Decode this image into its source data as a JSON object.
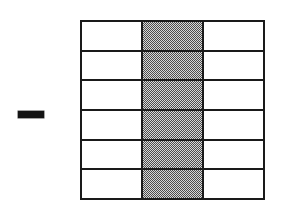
{
  "figure": {
    "operator_symbol": "—",
    "operator_name": "minus-dash",
    "rows": 6,
    "columns": 3,
    "total_cells": 18,
    "shaded_cells": 6,
    "shaded_column_index": 1,
    "fraction_shaded": "1/3",
    "colors": {
      "line": "#1a1a1a",
      "shade": "#9a9a9a",
      "background": "#ffffff",
      "dash": "#141414"
    },
    "grid": [
      {
        "row_label": "row-1",
        "cells": [
          {
            "name": "cell-r1c1",
            "shaded": false
          },
          {
            "name": "cell-r1c2",
            "shaded": true
          },
          {
            "name": "cell-r1c3",
            "shaded": false
          }
        ]
      },
      {
        "row_label": "row-2",
        "cells": [
          {
            "name": "cell-r2c1",
            "shaded": false
          },
          {
            "name": "cell-r2c2",
            "shaded": true
          },
          {
            "name": "cell-r2c3",
            "shaded": false
          }
        ]
      },
      {
        "row_label": "row-3",
        "cells": [
          {
            "name": "cell-r3c1",
            "shaded": false
          },
          {
            "name": "cell-r3c2",
            "shaded": true
          },
          {
            "name": "cell-r3c3",
            "shaded": false
          }
        ]
      },
      {
        "row_label": "row-4",
        "cells": [
          {
            "name": "cell-r4c1",
            "shaded": false
          },
          {
            "name": "cell-r4c2",
            "shaded": true
          },
          {
            "name": "cell-r4c3",
            "shaded": false
          }
        ]
      },
      {
        "row_label": "row-5",
        "cells": [
          {
            "name": "cell-r5c1",
            "shaded": false
          },
          {
            "name": "cell-r5c2",
            "shaded": true
          },
          {
            "name": "cell-r5c3",
            "shaded": false
          }
        ]
      },
      {
        "row_label": "row-6",
        "cells": [
          {
            "name": "cell-r6c1",
            "shaded": false
          },
          {
            "name": "cell-r6c2",
            "shaded": true
          },
          {
            "name": "cell-r6c3",
            "shaded": false
          }
        ]
      }
    ]
  }
}
